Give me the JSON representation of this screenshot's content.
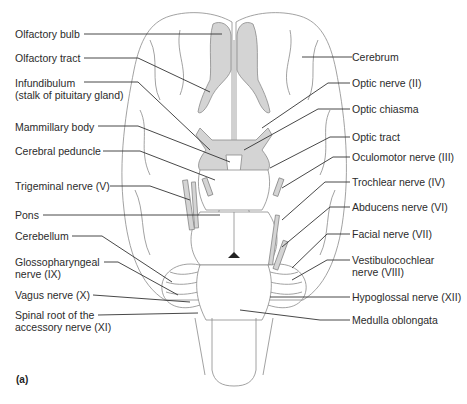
{
  "figure": {
    "panel_label": "(a)",
    "colors": {
      "structure_shading": "#d4d4d4",
      "outline": "#8a8a8a",
      "leader_line": "#333333",
      "text": "#2b2b2b"
    },
    "left_labels": [
      {
        "id": "olfactory-bulb",
        "lines": [
          "Olfactory bulb"
        ]
      },
      {
        "id": "olfactory-tract",
        "lines": [
          "Olfactory tract"
        ]
      },
      {
        "id": "infundibulum",
        "lines": [
          "Infundibulum",
          "(stalk of pituitary gland)"
        ]
      },
      {
        "id": "mammillary-body",
        "lines": [
          "Mammillary body"
        ]
      },
      {
        "id": "cerebral-peduncle",
        "lines": [
          "Cerebral peduncle"
        ]
      },
      {
        "id": "trigeminal-nerve",
        "lines": [
          "Trigeminal nerve (V)"
        ]
      },
      {
        "id": "pons",
        "lines": [
          "Pons"
        ]
      },
      {
        "id": "cerebellum",
        "lines": [
          "Cerebellum"
        ]
      },
      {
        "id": "glossopharyngeal-nerve",
        "lines": [
          "Glossopharyngeal",
          "nerve (IX)"
        ]
      },
      {
        "id": "vagus-nerve",
        "lines": [
          "Vagus nerve (X)"
        ]
      },
      {
        "id": "spinal-root-accessory-nerve",
        "lines": [
          "Spinal root of the",
          "accessory nerve (XI)"
        ]
      }
    ],
    "right_labels": [
      {
        "id": "cerebrum",
        "lines": [
          "Cerebrum"
        ]
      },
      {
        "id": "optic-nerve",
        "lines": [
          "Optic nerve (II)"
        ]
      },
      {
        "id": "optic-chiasma",
        "lines": [
          "Optic chiasma"
        ]
      },
      {
        "id": "optic-tract",
        "lines": [
          "Optic tract"
        ]
      },
      {
        "id": "oculomotor-nerve",
        "lines": [
          "Oculomotor nerve (III)"
        ]
      },
      {
        "id": "trochlear-nerve",
        "lines": [
          "Trochlear nerve (IV)"
        ]
      },
      {
        "id": "abducens-nerve",
        "lines": [
          "Abducens nerve (VI)"
        ]
      },
      {
        "id": "facial-nerve",
        "lines": [
          "Facial nerve (VII)"
        ]
      },
      {
        "id": "vestibulocochlear-nerve",
        "lines": [
          "Vestibulocochlear",
          "nerve (VIII)"
        ]
      },
      {
        "id": "hypoglossal-nerve",
        "lines": [
          "Hypoglossal nerve (XII)"
        ]
      },
      {
        "id": "medulla-oblongata",
        "lines": [
          "Medulla oblongata"
        ]
      }
    ]
  }
}
